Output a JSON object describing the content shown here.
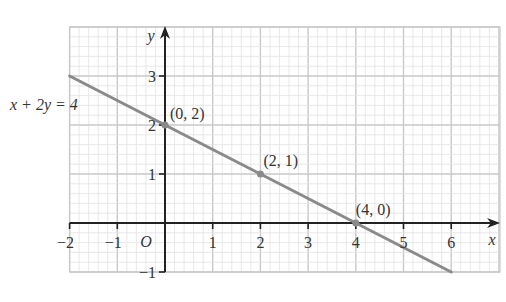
{
  "chart_data": {
    "type": "line",
    "title": "",
    "equation_label": "x + 2y = 4",
    "xlabel": "x",
    "ylabel": "y",
    "origin_label": "O",
    "xlim": [
      -2,
      6.5
    ],
    "ylim": [
      -1,
      4
    ],
    "x_ticks": [
      "−2",
      "−1",
      "1",
      "2",
      "3",
      "4",
      "5",
      "6"
    ],
    "y_ticks": [
      "−1",
      "1",
      "2",
      "3"
    ],
    "grid": true,
    "series": [
      {
        "name": "x + 2y = 4",
        "x": [
          -2,
          6
        ],
        "y": [
          3,
          -1
        ]
      }
    ],
    "points": [
      {
        "label": "(0, 2)",
        "x": 0,
        "y": 2
      },
      {
        "label": "(2, 1)",
        "x": 2,
        "y": 1
      },
      {
        "label": "(4, 0)",
        "x": 4,
        "y": 0
      }
    ]
  },
  "colors": {
    "line": "#8a8a8a",
    "axis": "#222222",
    "grid_major": "#c9c9c9",
    "grid_minor": "#e2e2e2"
  }
}
